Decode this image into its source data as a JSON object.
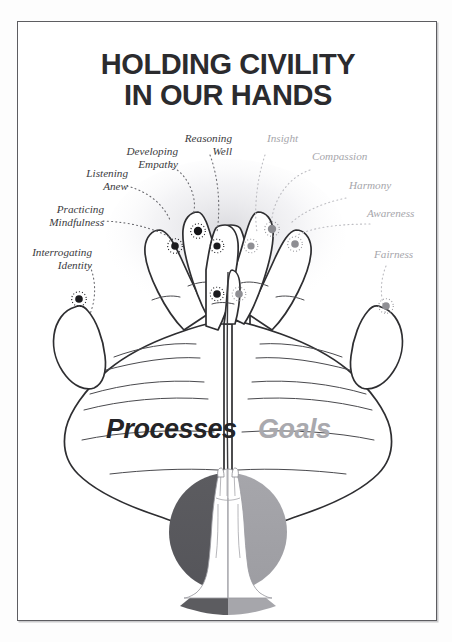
{
  "poster": {
    "title_line1": "HOLDING CIVILITY",
    "title_line2": "IN OUR HANDS",
    "title_color": "#2b2b2e",
    "frame_color": "#5d5d61",
    "background": "#ffffff"
  },
  "columns": {
    "left_heading": "Processes",
    "right_heading": "Goals",
    "left_color": "#242427",
    "right_color": "#a9a9ae"
  },
  "left_labels": [
    {
      "text": "Developing\nEmpathy",
      "color": "#3a3a3d"
    },
    {
      "text": "Reasoning\nWell",
      "color": "#3a3a3d"
    },
    {
      "text": "Listening\nAnew",
      "color": "#3a3a3d"
    },
    {
      "text": "Practicing\nMindfulness",
      "color": "#3a3a3d"
    },
    {
      "text": "Interrogating\nIdentity",
      "color": "#3a3a3d"
    }
  ],
  "right_labels": [
    {
      "text": "Insight",
      "color": "#a6a6ab"
    },
    {
      "text": "Compassion",
      "color": "#a6a6ab"
    },
    {
      "text": "Harmony",
      "color": "#a6a6ab"
    },
    {
      "text": "Awareness",
      "color": "#a6a6ab"
    },
    {
      "text": "Fairness",
      "color": "#a6a6ab"
    }
  ],
  "illustration": {
    "name": "two-cupped-hands-with-ten-marked-fingertips",
    "hand_outline_color": "#2e2e31",
    "left_dot_color": "#1c1c1f",
    "right_dot_color": "#8e8e93",
    "left_dot_count": 5,
    "right_dot_count": 5
  },
  "emblem": {
    "name": "praying-hands-in-circle",
    "left_half_color": "#58585c",
    "right_half_color": "#a3a3a8",
    "hands_color": "#ffffff"
  }
}
